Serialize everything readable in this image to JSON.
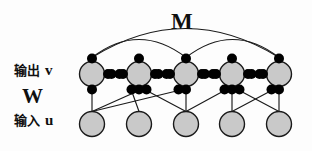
{
  "figure": {
    "title_labels": {
      "output_row": {
        "cjk": "输出",
        "symbol": "v"
      },
      "input_row": {
        "cjk": "输入",
        "symbol": "u"
      },
      "weight_matrix": "W",
      "lateral_matrix": "M"
    },
    "colors": {
      "node_fill": "#c9c9c9",
      "node_stroke": "#1a1a1a",
      "dot_fill": "#000000",
      "edge_stroke": "#1a1a1a",
      "background": "#fdfdfd"
    },
    "layout": {
      "output_row_y": 74,
      "input_row_y": 124,
      "node_radius": 12.5,
      "dot_radius": 5.0,
      "node_count": 5
    },
    "output_nodes": [
      {
        "id": "v1",
        "label": "",
        "cx": 92,
        "cy": 74
      },
      {
        "id": "v2",
        "label": "",
        "cx": 139,
        "cy": 74
      },
      {
        "id": "v3",
        "label": "",
        "cx": 186,
        "cy": 74
      },
      {
        "id": "v4",
        "label": "",
        "cx": 232,
        "cy": 74
      },
      {
        "id": "v5",
        "label": "",
        "cx": 279,
        "cy": 74
      }
    ],
    "input_nodes": [
      {
        "id": "u1",
        "label": "",
        "cx": 92,
        "cy": 124
      },
      {
        "id": "u2",
        "label": "",
        "cx": 139,
        "cy": 124
      },
      {
        "id": "u3",
        "label": "",
        "cx": 186,
        "cy": 124
      },
      {
        "id": "u4",
        "label": "",
        "cx": 232,
        "cy": 124
      },
      {
        "id": "u5",
        "label": "",
        "cx": 279,
        "cy": 124
      }
    ],
    "lateral_arcs": [
      {
        "from": "v1",
        "to": "v5",
        "rise": 58
      },
      {
        "from": "v1",
        "to": "v3",
        "rise": 36
      },
      {
        "from": "v3",
        "to": "v5",
        "rise": 36
      }
    ],
    "feedforward_edges": [
      {
        "from": "u1",
        "to": "v1"
      },
      {
        "from": "u1",
        "to": "v2"
      },
      {
        "from": "u2",
        "to": "v2"
      },
      {
        "from": "u3",
        "to": "v3"
      },
      {
        "from": "u4",
        "to": "v4"
      },
      {
        "from": "u5",
        "to": "v5"
      },
      {
        "from": "u1",
        "to": "v3"
      },
      {
        "from": "u3",
        "to": "v4"
      },
      {
        "from": "u4",
        "to": "v5"
      },
      {
        "from": "u5",
        "to": "v4"
      },
      {
        "from": "u3",
        "to": "v2"
      }
    ]
  }
}
